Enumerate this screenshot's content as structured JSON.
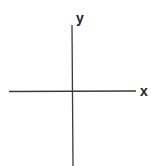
{
  "diagram": {
    "type": "cartesian-axes",
    "axes": {
      "x": {
        "label": "x"
      },
      "y": {
        "label": "y"
      }
    },
    "colors": {
      "line": "#3a3a3a",
      "text": "#222222",
      "background": "#ffffff"
    }
  }
}
